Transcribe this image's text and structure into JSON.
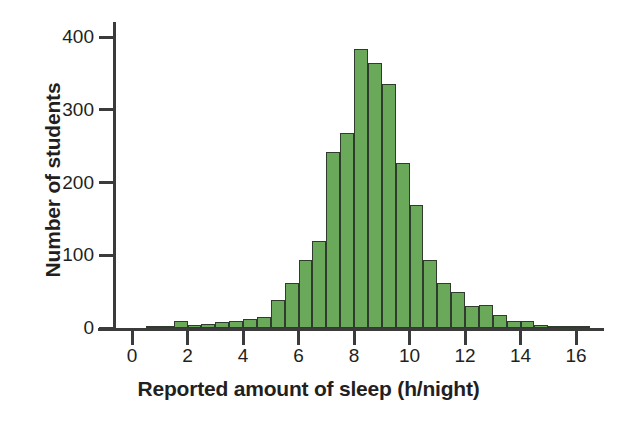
{
  "chart_data": {
    "type": "bar",
    "title": "",
    "subtitle": "",
    "xlabel": "Reported amount of sleep (h/night)",
    "ylabel": "Number of students",
    "bin_width": 0.5,
    "grid": false,
    "legend": "none",
    "xlim": [
      -0.5,
      17.0
    ],
    "ylim": [
      0,
      400
    ],
    "xticks": [
      0,
      2,
      4,
      6,
      8,
      10,
      12,
      14,
      16
    ],
    "xtick_labels": [
      "0",
      "2",
      "4",
      "6",
      "8",
      "10",
      "12",
      "14",
      "16"
    ],
    "yticks": [
      0,
      100,
      200,
      300,
      400
    ],
    "ytick_labels": [
      "0",
      "100",
      "200",
      "300",
      "400"
    ],
    "bar_color": "#6aa95a",
    "bar_edge_color": "#2f3b2c",
    "axis_color": "#3b3b3b",
    "text_color": "#231f20",
    "bins": [
      {
        "x0": 0.5,
        "x1": 1.0,
        "value": 2
      },
      {
        "x0": 1.0,
        "x1": 1.5,
        "value": 3
      },
      {
        "x0": 1.5,
        "x1": 2.0,
        "value": 9
      },
      {
        "x0": 2.0,
        "x1": 2.5,
        "value": 4
      },
      {
        "x0": 2.5,
        "x1": 3.0,
        "value": 5
      },
      {
        "x0": 3.0,
        "x1": 3.5,
        "value": 8
      },
      {
        "x0": 3.5,
        "x1": 4.0,
        "value": 9
      },
      {
        "x0": 4.0,
        "x1": 4.5,
        "value": 13
      },
      {
        "x0": 4.5,
        "x1": 5.0,
        "value": 15
      },
      {
        "x0": 5.0,
        "x1": 5.5,
        "value": 38
      },
      {
        "x0": 5.5,
        "x1": 6.0,
        "value": 62
      },
      {
        "x0": 6.0,
        "x1": 6.5,
        "value": 93
      },
      {
        "x0": 6.5,
        "x1": 7.0,
        "value": 120
      },
      {
        "x0": 7.0,
        "x1": 7.5,
        "value": 242
      },
      {
        "x0": 7.5,
        "x1": 8.0,
        "value": 268
      },
      {
        "x0": 8.0,
        "x1": 8.5,
        "value": 384
      },
      {
        "x0": 8.5,
        "x1": 9.0,
        "value": 364
      },
      {
        "x0": 9.0,
        "x1": 9.5,
        "value": 336
      },
      {
        "x0": 9.5,
        "x1": 10.0,
        "value": 227
      },
      {
        "x0": 10.0,
        "x1": 10.5,
        "value": 169
      },
      {
        "x0": 10.5,
        "x1": 11.0,
        "value": 94
      },
      {
        "x0": 11.0,
        "x1": 11.5,
        "value": 62
      },
      {
        "x0": 11.5,
        "x1": 12.0,
        "value": 49
      },
      {
        "x0": 12.0,
        "x1": 12.5,
        "value": 30
      },
      {
        "x0": 12.5,
        "x1": 13.0,
        "value": 31
      },
      {
        "x0": 13.0,
        "x1": 13.5,
        "value": 18
      },
      {
        "x0": 13.5,
        "x1": 14.0,
        "value": 10
      },
      {
        "x0": 14.0,
        "x1": 14.5,
        "value": 10
      },
      {
        "x0": 14.5,
        "x1": 15.0,
        "value": 4
      },
      {
        "x0": 15.0,
        "x1": 15.5,
        "value": 2
      },
      {
        "x0": 15.5,
        "x1": 16.0,
        "value": 3
      },
      {
        "x0": 16.0,
        "x1": 16.5,
        "value": 1
      }
    ]
  }
}
